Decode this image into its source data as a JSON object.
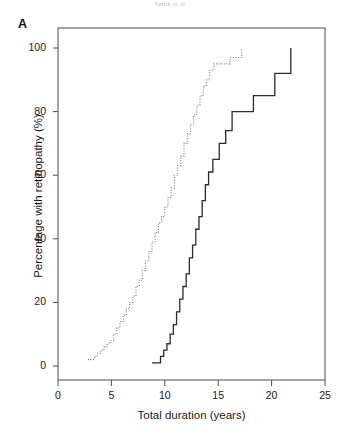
{
  "running_head": "Smith et al.",
  "panel": {
    "label": "A"
  },
  "chart_data": {
    "type": "line",
    "title": "",
    "xlabel": "Total duration (years)",
    "ylabel": "Percentage with retinopathy (%)",
    "xlim": [
      0,
      25
    ],
    "ylim": [
      0,
      100
    ],
    "xticks": [
      0,
      5,
      10,
      15,
      20,
      25
    ],
    "yticks": [
      0,
      20,
      40,
      60,
      80,
      100
    ],
    "xtick_labels": [
      "0",
      "5",
      "10",
      "15",
      "20",
      "25"
    ],
    "ytick_labels": [
      "0",
      "20",
      "40",
      "60",
      "80",
      "100"
    ],
    "grid": false,
    "legend": "none",
    "frame": "box",
    "step_type": "post",
    "series": [
      {
        "name": "dotted-cumulative-curve",
        "style": "dotted",
        "color": "#7d7d7d",
        "width": 1.1,
        "x": [
          2.8,
          3.1,
          3.4,
          3.7,
          4.0,
          4.3,
          4.6,
          4.9,
          5.2,
          5.5,
          5.8,
          6.1,
          6.4,
          6.7,
          7.0,
          7.3,
          7.6,
          7.9,
          8.2,
          8.5,
          8.8,
          9.1,
          9.4,
          9.7,
          10.0,
          10.3,
          10.6,
          10.9,
          11.2,
          11.5,
          11.8,
          12.1,
          12.4,
          12.7,
          13.0,
          13.3,
          13.6,
          13.9,
          14.2,
          14.6,
          15.6,
          16.1,
          16.7,
          17.2
        ],
        "y": [
          2,
          2,
          3,
          4,
          5,
          6,
          7,
          8,
          10,
          12,
          14,
          16,
          18,
          20,
          22,
          25,
          27,
          30,
          33,
          36,
          39,
          42,
          45,
          47,
          50,
          53,
          56,
          60,
          63,
          66,
          70,
          73,
          76,
          79,
          82,
          85,
          88,
          90,
          93,
          95,
          95,
          97,
          97,
          100
        ]
      },
      {
        "name": "solid-cumulative-curve",
        "style": "solid",
        "color": "#2b2b2b",
        "width": 1.3,
        "x": [
          8.8,
          9.2,
          9.6,
          9.9,
          10.2,
          10.5,
          10.8,
          11.1,
          11.4,
          11.7,
          12.0,
          12.3,
          12.6,
          12.9,
          13.2,
          13.5,
          13.8,
          14.1,
          14.5,
          15.1,
          15.7,
          16.3,
          17.3,
          18.3,
          19.3,
          20.3,
          21.8
        ],
        "y": [
          1,
          1,
          3,
          5,
          7,
          10,
          13,
          17,
          21,
          25,
          29,
          34,
          38,
          43,
          47,
          52,
          57,
          61,
          65,
          70,
          74,
          80,
          80,
          85,
          85,
          92,
          100
        ]
      }
    ]
  }
}
